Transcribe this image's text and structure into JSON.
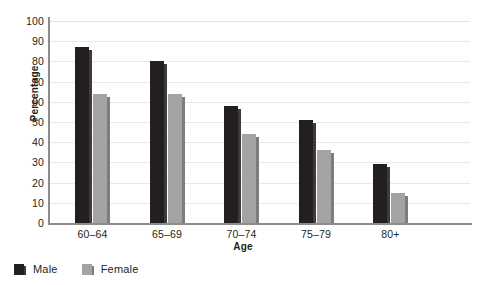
{
  "chart_data": {
    "type": "bar",
    "title": "",
    "xlabel": "Age",
    "ylabel": "Percentage",
    "categories": [
      "60–64",
      "65–69",
      "70–74",
      "75–79",
      "80+"
    ],
    "series": [
      {
        "name": "Male",
        "color": "#231f20",
        "values": [
          87,
          80,
          58,
          51,
          29
        ]
      },
      {
        "name": "Female",
        "color": "#a3a3a3",
        "values": [
          64,
          64,
          44,
          36,
          15
        ]
      }
    ],
    "ylim": [
      0,
      100
    ],
    "yticks": [
      0,
      10,
      20,
      30,
      40,
      50,
      60,
      70,
      80,
      90,
      100
    ],
    "ytick_labels": [
      "0",
      "10",
      "20",
      "30",
      "40",
      "50",
      "60",
      "70",
      "80",
      "90",
      "100"
    ],
    "grid": true,
    "grid_color": "#e9e9e9",
    "legend_position": "bottom-left",
    "legend": [
      "Male",
      "Female"
    ]
  }
}
